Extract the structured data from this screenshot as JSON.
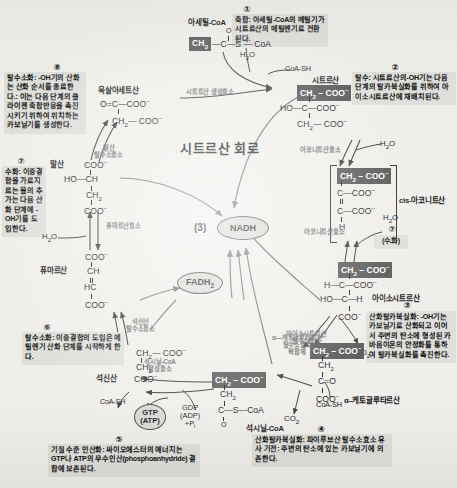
{
  "title": "시트르산 회로",
  "center": {
    "nadh_count": "(3)",
    "nadh_label": "NADH",
    "fadh2_label": "FADH2",
    "fadh2_sub": "2"
  },
  "notes": [
    {
      "id": "note-1",
      "number": "①",
      "lead": "축합:",
      "text": "축합: 아세틸-CoA의 메틸기가 시트르산의 메틸렌기로 전환된다."
    },
    {
      "id": "note-2",
      "number": "②",
      "lead": "탈수:",
      "text": "탈수: 시트르산의-OH기는 다음 단계의 탈카복실화를 위하여 아이소시트르산에 재배치된다."
    },
    {
      "id": "note-3",
      "number": "③",
      "lead": "산화탈카복실화:",
      "text": "산화탈카복실화: -OH기는 카보닐기로 산화되고 이어서 주변의 탄소에 형성된 카바음이온의 안정화를 통하여 탈카복실화를 촉진한다."
    },
    {
      "id": "note-4",
      "number": "④",
      "lead": "산화탈카복실화:",
      "text": "산화탈카복실화: 파이루브산 탈수소효소 유사 기전: 주변의 탄소에 있는 카보닐기에 의존한다."
    },
    {
      "id": "note-5",
      "number": "⑤",
      "lead": "기질 수준 인산화:",
      "text": "기질 수준 인산화: 싸이오에스터의 에너지는 GTP나 ATP의 무수인산(phosphoanhydride) 결합에 보존된다."
    },
    {
      "id": "note-6",
      "number": "⑥",
      "lead": "탈수소화:",
      "text": "탈수소화: 이중결합의 도입은 메틸렌기 산화 단계를 시작하게 한다."
    },
    {
      "id": "note-7",
      "number": "⑦",
      "lead": "수화:",
      "text": "수화: 이중결합을 가로지르는 물의 추가는 다음 산화 단계에 -OH기를 도입한다."
    },
    {
      "id": "note-8",
      "number": "⑧",
      "lead": "탈수소화:",
      "text": "탈수소화: -OH기의 산화는 산화 순서를 종료한다.: 이는 다음 단계의 클라이젠 축합반응을 촉진시키기 위하여 위치하는 카보닐기를 생성한다."
    },
    {
      "id": "note-hydration",
      "number": "⑦",
      "lead": "(수화)",
      "text": "(수화)"
    }
  ],
  "molecules": {
    "acetyl_coa": {
      "name": "아세틸-CoA",
      "formula_hl": "CH3",
      "formula_rest": "—C—S — CoA",
      "o_label": "O"
    },
    "citrate": {
      "name": "시트르산",
      "l1_hl": "CH2 – COO–",
      "l2": "HO—C—COO–",
      "l3": "CH2— COO–"
    },
    "cis_aconitate": {
      "name": "cis-아코니트산",
      "l1_hl": "CH2 – COO–",
      "l2": "C—COO–",
      "l3": "C—COO–",
      "l4": "H"
    },
    "isocitrate": {
      "name": "아이소시트르산",
      "l1_hl": "CH2 – COO–",
      "l2": "H—C—COO–",
      "l3": "HO—C—H",
      "l4": "COO–"
    },
    "alpha_ketoglutarate": {
      "name": "α–케토글루타르산",
      "l1_hl": "CH2 – COO–",
      "l2": "CH2",
      "l3": "C=O",
      "l4": "COO–"
    },
    "succinyl_coa": {
      "name": "석시닐-CoA",
      "l1_hl": "CH2 – COO–",
      "l2": "CH2",
      "l3": "C—S—CoA",
      "l4": "O"
    },
    "succinate": {
      "name": "석신산",
      "l1": "CH2— COO–",
      "l2": "CH2",
      "l3": "COO–"
    },
    "fumarate": {
      "name": "퓨마르산",
      "l1": "COO–",
      "l2": "CH",
      "l3": "HC",
      "l4": "COO–"
    },
    "malate": {
      "name": "말산",
      "l1": "COO–",
      "l2": "HO—CH",
      "l3": "CH2",
      "l4": "COO–"
    },
    "oxaloacetate": {
      "name": "옥살아세트산",
      "l1": "O=C—COO–",
      "l2": "CH2— COO–"
    }
  },
  "enzymes": {
    "citrate_synthase": "시트르산 생성효소",
    "aconitase_top": "아코니트산효소",
    "aconitase_bottom": "아코니트산효소",
    "isocitrate_dehydrogenase": "아이소시트르산\n탈수소효소",
    "akg_dehydrogenase_complex": "α—케토글루타르산\n탈수소효소\n복합체",
    "succinyl_coa_synthetase": "석시닐-CoA\n합성효소",
    "succinate_dehydrogenase": "석신산\n탈수소효소",
    "fumarase": "퓨마르산효소",
    "malate_dehydrogenase": "말산\n탈수소효소"
  },
  "cofactors": {
    "coa_sh_top": "CoA-SH",
    "coa_sh_mid": "CoA-SH",
    "coa_sh_bottom": "CoA-SH",
    "h2o_acetyl": "H2O",
    "h2o_citrate": "H2O",
    "h2o_aconitate": "H2O",
    "h2o_fumarate": "H2O",
    "h2o_malate": "H2O",
    "co2_isocitrate": "CO2",
    "co2_akg": "CO2",
    "gtp_atp_line1": "GTP",
    "gtp_atp_line2": "(ATP)",
    "gdp_line1": "GDP",
    "gdp_line2": "(ADP)",
    "gdp_line3": "+Pi"
  }
}
